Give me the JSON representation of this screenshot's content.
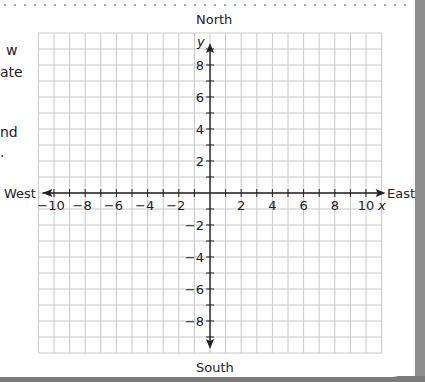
{
  "chart_data": {
    "type": "coordinate-grid",
    "title": "",
    "xlabel": "x",
    "ylabel": "y",
    "xlim": [
      -11,
      11
    ],
    "ylim": [
      -10,
      10
    ],
    "grid": true,
    "x_ticks": [
      -10,
      -8,
      -6,
      -4,
      -2,
      2,
      4,
      6,
      8,
      10
    ],
    "y_ticks": [
      8,
      6,
      4,
      2,
      -2,
      -4,
      -6,
      -8
    ],
    "directions": {
      "north": "North",
      "south": "South",
      "east": "East",
      "west": "West"
    },
    "series": []
  },
  "page": {
    "cut_text": [
      "w",
      "ate",
      "nd",
      "."
    ]
  },
  "colors": {
    "grid": "#c8c8c8",
    "axis": "#222222",
    "border_gray": "#8e8e8e"
  }
}
